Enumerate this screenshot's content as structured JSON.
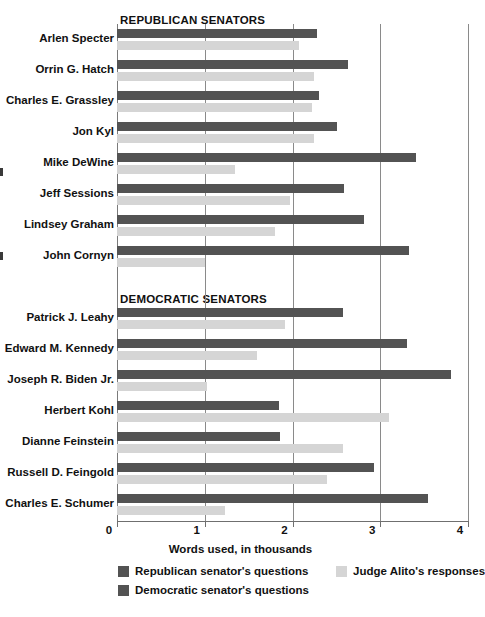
{
  "chart_data": {
    "type": "bar",
    "orientation": "horizontal",
    "title": "",
    "xlabel": "Words used, in thousands",
    "ylabel": "",
    "xlim": [
      0,
      4
    ],
    "xticks": [
      0,
      1,
      2,
      3,
      4
    ],
    "xtick_labels": [
      "0",
      "1",
      "2",
      "3",
      "4"
    ],
    "grid": "vertical",
    "legend_position": "bottom",
    "legend": [
      {
        "key": "republican_questions",
        "label": "Republican senator's questions",
        "color": "#535353"
      },
      {
        "key": "democratic_questions",
        "label": "Democratic senator's questions",
        "color": "#535353"
      },
      {
        "key": "alito_responses",
        "label": "Judge Alito's responses",
        "color": "#d5d5d5"
      }
    ],
    "groups": [
      {
        "name": "REPUBLICAN SENATORS",
        "series_key": "republican_questions",
        "categories": [
          "Arlen Specter",
          "Orrin G. Hatch",
          "Charles E. Grassley",
          "Jon Kyl",
          "Mike DeWine",
          "Jeff Sessions",
          "Lindsey Graham",
          "John Cornyn"
        ],
        "senator_questions": [
          2.28,
          2.63,
          2.3,
          2.51,
          3.41,
          2.59,
          2.82,
          3.33
        ],
        "alito_responses": [
          2.07,
          2.25,
          2.22,
          2.24,
          1.34,
          1.97,
          1.8,
          1.0
        ]
      },
      {
        "name": "DEMOCRATIC SENATORS",
        "series_key": "democratic_questions",
        "categories": [
          "Patrick J. Leahy",
          "Edward M. Kennedy",
          "Joseph R. Biden Jr.",
          "Herbert Kohl",
          "Dianne Feinstein",
          "Russell D. Feingold",
          "Charles E. Schumer"
        ],
        "senator_questions": [
          2.57,
          3.3,
          3.81,
          1.85,
          1.86,
          2.93,
          3.54
        ],
        "alito_responses": [
          1.91,
          1.59,
          1.03,
          3.1,
          2.57,
          2.39,
          1.23
        ]
      }
    ]
  }
}
